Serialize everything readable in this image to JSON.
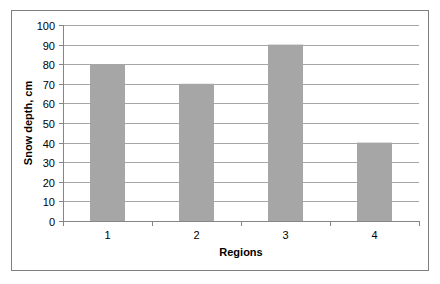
{
  "chart_data": {
    "type": "bar",
    "title": "",
    "xlabel": "Regions",
    "ylabel": "Snow depth, cm",
    "categories": [
      "1",
      "2",
      "3",
      "4"
    ],
    "values": [
      80,
      70,
      90,
      40
    ],
    "ylim": [
      0,
      100
    ],
    "yticks": [
      0,
      10,
      20,
      30,
      40,
      50,
      60,
      70,
      80,
      90,
      100
    ],
    "grid": true,
    "legend": null,
    "bar_color": "#a6a6a6",
    "grid_color": "#a6a6a6"
  }
}
